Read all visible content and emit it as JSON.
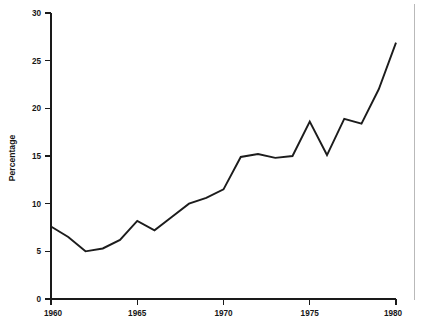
{
  "chart_data": {
    "type": "line",
    "title": "",
    "subtitle": "",
    "xlabel": "",
    "ylabel": "Percentage",
    "x": [
      1960,
      1961,
      1962,
      1963,
      1964,
      1965,
      1966,
      1967,
      1968,
      1969,
      1970,
      1971,
      1972,
      1973,
      1974,
      1975,
      1976,
      1977,
      1978,
      1979,
      1980
    ],
    "values": [
      7.6,
      6.5,
      5.0,
      5.3,
      6.2,
      8.2,
      7.2,
      8.6,
      10.0,
      10.6,
      11.5,
      14.9,
      15.2,
      14.8,
      15.0,
      18.6,
      15.1,
      18.9,
      18.4,
      22.0,
      26.9
    ],
    "series": [
      {
        "name": "Percentage",
        "values": [
          7.6,
          6.5,
          5.0,
          5.3,
          6.2,
          8.2,
          7.2,
          8.6,
          10.0,
          10.6,
          11.5,
          14.9,
          15.2,
          14.8,
          15.0,
          18.6,
          15.1,
          18.9,
          18.4,
          22.0,
          26.9
        ],
        "color": "#1c1c1c"
      }
    ],
    "xlim": [
      1960,
      1980
    ],
    "ylim": [
      0,
      30
    ],
    "x_ticks": [
      1960,
      1965,
      1970,
      1975,
      1980
    ],
    "x_tick_labels": [
      "1960",
      "1965",
      "1970",
      "1975",
      "1980"
    ],
    "y_ticks": [
      0,
      5,
      10,
      15,
      20,
      25,
      30
    ],
    "y_tick_labels": [
      "0",
      "5",
      "10",
      "15",
      "20",
      "25",
      "30"
    ],
    "grid": false,
    "legend": false,
    "legend_position": "none",
    "annotations": [],
    "line_color": "#1c1c1c",
    "axis_color": "#1a1a1a",
    "background_color": "#ffffff"
  },
  "labels": {
    "y_axis_title": "Percentage",
    "y0": "0",
    "y5": "5",
    "y10": "10",
    "y15": "15",
    "y20": "20",
    "y25": "25",
    "y30": "30",
    "x1960": "1960",
    "x1965": "1965",
    "x1970": "1970",
    "x1975": "1975",
    "x1980": "1980"
  }
}
